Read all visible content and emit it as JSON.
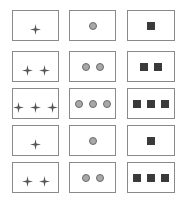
{
  "puzzle": {
    "columns": [
      "star",
      "circle",
      "square"
    ],
    "colors": {
      "border": "#8a8a8a",
      "star": "#555555",
      "circle_fill": "#a8a8a8",
      "square_fill": "#3a3a3a"
    },
    "rows": [
      {
        "star": 1,
        "circle": 1,
        "square": 1
      },
      {
        "star": 2,
        "circle": 2,
        "square": 2
      },
      {
        "star": 3,
        "circle": 3,
        "square": 3
      },
      {
        "star": 1,
        "circle": 1,
        "square": 1
      },
      {
        "star": 2,
        "circle": 2,
        "square": 3
      }
    ]
  }
}
